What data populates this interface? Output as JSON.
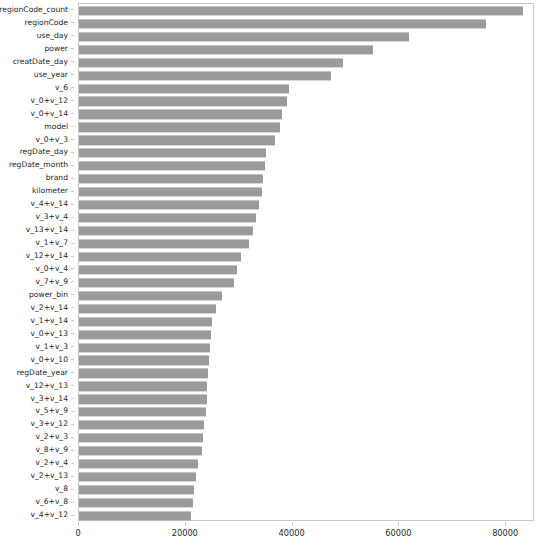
{
  "chart_data": {
    "type": "bar",
    "orientation": "horizontal",
    "title": "",
    "subtitle": "",
    "xlabel": "",
    "ylabel": "",
    "xlim": [
      0,
      85400
    ],
    "grid": false,
    "legend": null,
    "bar_color": "#9b9b9b",
    "xticks": [
      0,
      20000,
      40000,
      60000,
      80000
    ],
    "xticklabels": [
      "0",
      "20000",
      "40000",
      "60000",
      "80000"
    ],
    "categories": [
      "regionCode_count",
      "regionCode",
      "use_day",
      "power",
      "creatDate_day",
      "use_year",
      "v_6",
      "v_0+v_12",
      "v_0+v_14",
      "model",
      "v_0+v_3",
      "regDate_day",
      "regDate_month",
      "brand",
      "kilometer",
      "v_4+v_14",
      "v_3+v_4",
      "v_13+v_14",
      "v_1+v_7",
      "v_12+v_14",
      "v_0+v_4",
      "v_7+v_9",
      "power_bin",
      "v_2+v_14",
      "v_1+v_14",
      "v_0+v_13",
      "v_1+v_3",
      "v_0+v_10",
      "regDate_year",
      "v_12+v_13",
      "v_3+v_14",
      "v_5+v_9",
      "v_3+v_12",
      "v_2+v_3",
      "v_8+v_9",
      "v_2+v_4",
      "v_2+v_13",
      "v_8",
      "v_6+v_8",
      "v_4+v_12"
    ],
    "values": [
      83200,
      76200,
      61800,
      55100,
      49500,
      47200,
      39300,
      39000,
      38000,
      37600,
      36800,
      35000,
      34800,
      34500,
      34200,
      33800,
      33100,
      32600,
      31800,
      30400,
      29600,
      29000,
      26800,
      25600,
      25000,
      24800,
      24600,
      24400,
      24200,
      24000,
      23900,
      23700,
      23500,
      23300,
      23000,
      22200,
      22000,
      21600,
      21400,
      20900
    ]
  }
}
